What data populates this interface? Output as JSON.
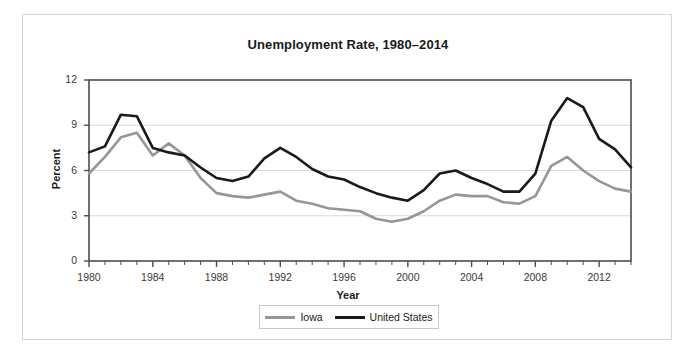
{
  "figure": {
    "title": "Unemployment Rate, 1980–2014",
    "background": "#ffffff",
    "border_color": "#d4d4d4"
  },
  "axes": {
    "xlabel": "Year",
    "ylabel": "Percent",
    "xticks": [
      "1980",
      "1984",
      "1988",
      "1992",
      "1996",
      "2000",
      "2004",
      "2008",
      "2012"
    ],
    "yticks": [
      "0",
      "3",
      "6",
      "9",
      "12"
    ]
  },
  "legend": {
    "entries": [
      {
        "label": "Iowa",
        "color": "#969696"
      },
      {
        "label": "United States",
        "color": "#1a1a1a"
      }
    ]
  },
  "chart_data": {
    "type": "line",
    "title": "Unemployment Rate, 1980–2014",
    "xlabel": "Year",
    "ylabel": "Percent",
    "xlim": [
      1980,
      2014
    ],
    "ylim": [
      0,
      12
    ],
    "xtick_step": 4,
    "ytick_step": 3,
    "minor_xtick_step": 1,
    "grid": "horizontal",
    "legend_position": "bottom",
    "x": [
      1980,
      1981,
      1982,
      1983,
      1984,
      1985,
      1986,
      1987,
      1988,
      1989,
      1990,
      1991,
      1992,
      1993,
      1994,
      1995,
      1996,
      1997,
      1998,
      1999,
      2000,
      2001,
      2002,
      2003,
      2004,
      2005,
      2006,
      2007,
      2008,
      2009,
      2010,
      2011,
      2012,
      2013,
      2014
    ],
    "series": [
      {
        "name": "Iowa",
        "color": "#969696",
        "values": [
          5.8,
          6.9,
          8.2,
          8.5,
          7.0,
          7.8,
          7.0,
          5.5,
          4.5,
          4.3,
          4.2,
          4.4,
          4.6,
          4.0,
          3.8,
          3.5,
          3.4,
          3.3,
          2.8,
          2.6,
          2.8,
          3.3,
          4.0,
          4.4,
          4.3,
          4.3,
          3.9,
          3.8,
          4.3,
          6.3,
          6.9,
          6.0,
          5.3,
          4.8,
          4.6
        ]
      },
      {
        "name": "United States",
        "color": "#1a1a1a",
        "values": [
          7.2,
          7.6,
          9.7,
          9.6,
          7.5,
          7.2,
          7.0,
          6.2,
          5.5,
          5.3,
          5.6,
          6.8,
          7.5,
          6.9,
          6.1,
          5.6,
          5.4,
          4.9,
          4.5,
          4.2,
          4.0,
          4.7,
          5.8,
          6.0,
          5.5,
          5.1,
          4.6,
          4.6,
          5.8,
          9.3,
          10.8,
          10.2,
          8.1,
          7.4,
          6.2
        ]
      }
    ]
  }
}
